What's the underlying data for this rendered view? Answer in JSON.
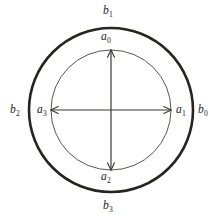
{
  "figure": {
    "background_color": "#ffffff",
    "geometry": {
      "width": 223,
      "height": 221,
      "center_x": 111,
      "center_y": 110,
      "outer_radius": 82,
      "inner_radius": 60,
      "outer_stroke_width": 2.6,
      "inner_stroke_width": 1.0,
      "arrow_stroke_width": 1.2
    },
    "colors": {
      "outer_circle": "#262620",
      "inner_circle": "#55584f",
      "arrow": "#3a3d35",
      "label": "#1c1c18"
    },
    "outer_circle_label": "outer-circle",
    "inner_circle_label": "inner-circle"
  },
  "labels": {
    "inner": [
      {
        "id": "a0",
        "base": "a",
        "sub": "0",
        "position": "top"
      },
      {
        "id": "a1",
        "base": "a",
        "sub": "1",
        "position": "right"
      },
      {
        "id": "a2",
        "base": "a",
        "sub": "2",
        "position": "bottom"
      },
      {
        "id": "a3",
        "base": "a",
        "sub": "3",
        "position": "left"
      }
    ],
    "outer": [
      {
        "id": "b0",
        "base": "b",
        "sub": "0",
        "position": "right"
      },
      {
        "id": "b1",
        "base": "b",
        "sub": "1",
        "position": "top"
      },
      {
        "id": "b2",
        "base": "b",
        "sub": "2",
        "position": "left"
      },
      {
        "id": "b3",
        "base": "b",
        "sub": "3",
        "position": "bottom"
      }
    ]
  },
  "arrows": [
    {
      "id": "arrow-up",
      "direction": "vertical-up",
      "from": "center",
      "to": "inner-circle-top"
    },
    {
      "id": "arrow-right",
      "direction": "horizontal-right",
      "from": "center",
      "to": "inner-circle-right"
    },
    {
      "id": "arrow-down",
      "direction": "vertical-down",
      "from": "center",
      "to": "inner-circle-bottom"
    },
    {
      "id": "arrow-left",
      "direction": "horizontal-left",
      "from": "center",
      "to": "inner-circle-left"
    }
  ]
}
